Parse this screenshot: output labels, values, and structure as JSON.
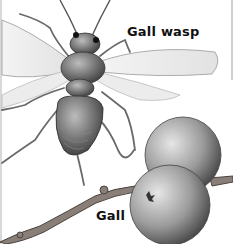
{
  "illustration": {
    "subject": "Gall wasp and oak galls",
    "labels": {
      "wasp": "Gall wasp",
      "gall": "Gall"
    },
    "colors": {
      "background": "#ffffff",
      "ink": "#111111",
      "gall_light": "#d9d9d9",
      "gall_dark": "#5a5a5a",
      "wing": "#eeeeee"
    }
  }
}
